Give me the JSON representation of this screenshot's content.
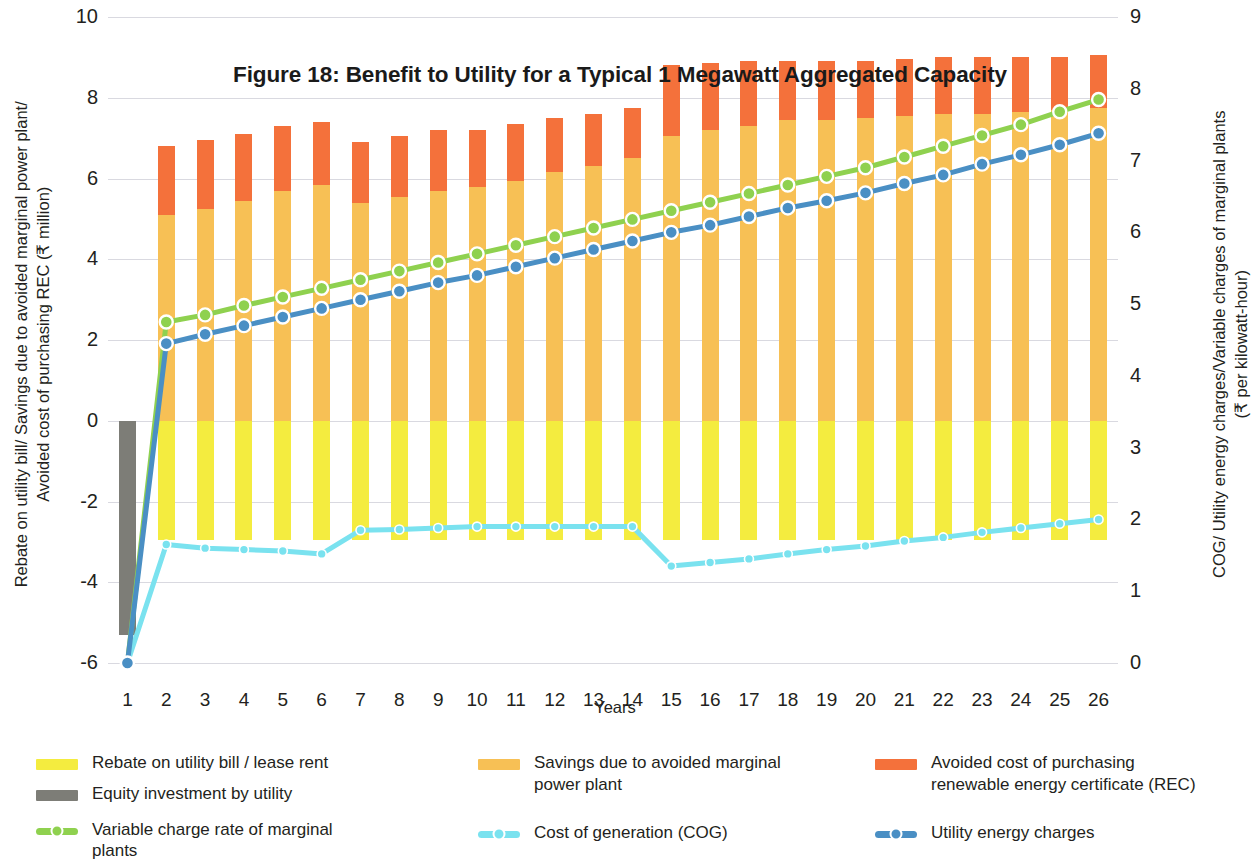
{
  "chart_data": {
    "type": "bar",
    "title": "Figure 18: Benefit to Utility for a Typical 1 Megawatt Aggregated Capacity",
    "xlabel": "Years",
    "ylabel_left": "Rebate on utility bill/ Savings due to avoided marginal power plant/\nAvoided cost of purchasing REC (₹ million)",
    "ylabel_right": "COG/ Utility energy charges/Variable charges of marginal plants\n(₹ per kilowatt-hour)",
    "categories": [
      "1",
      "2",
      "3",
      "4",
      "5",
      "6",
      "7",
      "8",
      "9",
      "10",
      "11",
      "12",
      "13",
      "14",
      "15",
      "16",
      "17",
      "18",
      "19",
      "20",
      "21",
      "22",
      "23",
      "24",
      "25",
      "26"
    ],
    "ylim_left": [
      -6,
      10
    ],
    "ylim_right": [
      0,
      9
    ],
    "yticks_left": [
      "10",
      "8",
      "6",
      "4",
      "2",
      "0",
      "-2",
      "-4",
      "-6"
    ],
    "yticks_right": [
      "9",
      "8",
      "7",
      "6",
      "5",
      "4",
      "3",
      "2",
      "1",
      "0"
    ],
    "grid": true,
    "legend_position": "bottom",
    "series": [
      {
        "name": "Rebate on utility bill / lease rent",
        "type": "bar",
        "axis": "left",
        "color": "#f4ec3f",
        "values": [
          0,
          -2.95,
          -2.95,
          -2.95,
          -2.95,
          -2.95,
          -2.95,
          -2.95,
          -2.95,
          -2.95,
          -2.95,
          -2.95,
          -2.95,
          -2.95,
          -2.95,
          -2.95,
          -2.95,
          -2.95,
          -2.95,
          -2.95,
          -2.95,
          -2.95,
          -2.95,
          -2.95,
          -2.95,
          -2.95
        ]
      },
      {
        "name": "Equity investment by utility",
        "type": "bar",
        "axis": "left",
        "color": "#7d7d77",
        "values": [
          -5.3,
          0,
          0,
          0,
          0,
          0,
          0,
          0,
          0,
          0,
          0,
          0,
          0,
          0,
          0,
          0,
          0,
          0,
          0,
          0,
          0,
          0,
          0,
          0,
          0,
          0
        ]
      },
      {
        "name": "Savings due to avoided marginal power plant",
        "type": "bar",
        "axis": "left",
        "color": "#f7c055",
        "values": [
          0,
          5.1,
          5.25,
          5.45,
          5.7,
          5.85,
          5.4,
          5.55,
          5.7,
          5.8,
          5.95,
          6.15,
          6.3,
          6.5,
          7.05,
          7.2,
          7.3,
          7.45,
          7.45,
          7.5,
          7.55,
          7.6,
          7.6,
          7.65,
          7.7,
          7.75
        ]
      },
      {
        "name": "Avoided cost of purchasing renewable energy certificate (REC)",
        "type": "bar",
        "axis": "left",
        "color": "#f4713b",
        "values": [
          0,
          1.7,
          1.7,
          1.65,
          1.6,
          1.55,
          1.5,
          1.5,
          1.5,
          1.4,
          1.4,
          1.35,
          1.3,
          1.25,
          1.75,
          1.65,
          1.6,
          1.45,
          1.45,
          1.4,
          1.4,
          1.4,
          1.4,
          1.35,
          1.3,
          1.3
        ]
      },
      {
        "name": "Variable charge rate of marginal plants",
        "type": "line",
        "axis": "right",
        "color": "#8fd14f",
        "values": [
          0.0,
          4.75,
          4.85,
          4.98,
          5.1,
          5.22,
          5.34,
          5.46,
          5.58,
          5.7,
          5.82,
          5.94,
          6.06,
          6.18,
          6.3,
          6.42,
          6.54,
          6.66,
          6.78,
          6.9,
          7.05,
          7.2,
          7.35,
          7.5,
          7.68,
          7.85
        ]
      },
      {
        "name": "Cost of generation (COG)",
        "type": "line",
        "axis": "right",
        "color": "#7ae2ef",
        "values": [
          0.0,
          1.65,
          1.6,
          1.58,
          1.56,
          1.52,
          1.85,
          1.86,
          1.88,
          1.9,
          1.9,
          1.9,
          1.9,
          1.9,
          1.35,
          1.4,
          1.45,
          1.52,
          1.58,
          1.63,
          1.7,
          1.75,
          1.82,
          1.88,
          1.94,
          2.0
        ]
      },
      {
        "name": "Utility energy charges",
        "type": "line",
        "axis": "right",
        "color": "#4a8fc4",
        "values": [
          0.0,
          4.45,
          4.58,
          4.7,
          4.82,
          4.94,
          5.06,
          5.18,
          5.3,
          5.4,
          5.52,
          5.64,
          5.76,
          5.88,
          6.0,
          6.1,
          6.22,
          6.34,
          6.44,
          6.55,
          6.68,
          6.8,
          6.95,
          7.08,
          7.22,
          7.38
        ]
      }
    ]
  },
  "legend": {
    "columns": [
      {
        "items": [
          {
            "label": "Rebate on utility bill / lease rent",
            "color": "#f4ec3f",
            "style": "bar"
          },
          {
            "label": "Equity investment by utility",
            "color": "#7d7d77",
            "style": "bar"
          },
          {
            "label": "Variable charge rate of marginal plants",
            "color": "#8fd14f",
            "style": "line"
          }
        ]
      },
      {
        "items": [
          {
            "label": "Savings due to avoided marginal power plant",
            "color": "#f7c055",
            "style": "bar"
          },
          {
            "label": "Cost of generation (COG)",
            "color": "#7ae2ef",
            "style": "line"
          }
        ]
      },
      {
        "items": [
          {
            "label": "Avoided cost of purchasing renewable energy certificate (REC)",
            "color": "#f4713b",
            "style": "bar"
          },
          {
            "label": "Utility energy charges",
            "color": "#4a8fc4",
            "style": "line"
          }
        ]
      }
    ]
  }
}
